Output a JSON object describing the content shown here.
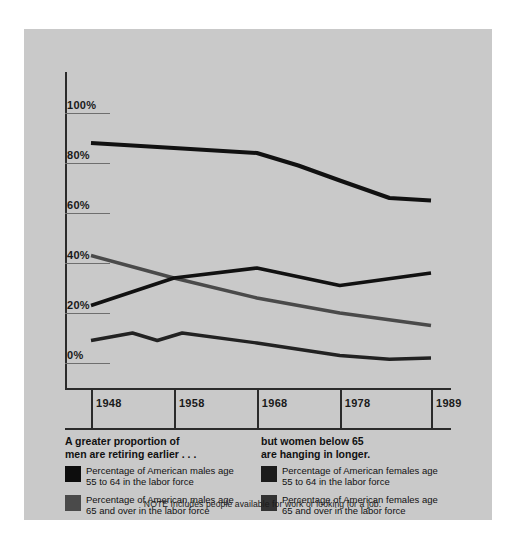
{
  "chart_data": {
    "type": "line",
    "title": "",
    "xlabel": "",
    "ylabel": "",
    "x": [
      1948,
      1958,
      1968,
      1978,
      1989
    ],
    "xtick_labels": [
      "1948",
      "1958",
      "1968",
      "1978",
      "1989"
    ],
    "ytick_labels": [
      "100%",
      "80%",
      "60%",
      "40%",
      "20%",
      "0%"
    ],
    "ytick_values": [
      100,
      80,
      60,
      40,
      20,
      0
    ],
    "ylim": [
      0,
      100
    ],
    "grid": false,
    "legend_position": "bottom",
    "series": [
      {
        "name": "Percentage of American males age 55 to 64 in the labor force",
        "color": "#111111",
        "values": [
          88,
          86,
          84,
          73,
          65
        ]
      },
      {
        "name": "Percentage of American males age 65 and over in the labor force",
        "color": "#4a4a4a",
        "values": [
          43,
          34,
          26,
          20,
          15
        ]
      },
      {
        "name": "Percentage of American females age 55 to 64 in the labor force",
        "color": "#111111",
        "values": [
          23,
          34,
          38,
          31,
          36
        ]
      },
      {
        "name": "Percentage of American females age 65 and over in the labor force",
        "color": "#222222",
        "values": [
          9,
          10,
          8,
          3,
          2
        ]
      }
    ],
    "extra_points": {
      "females_65_wiggle": [
        {
          "x": 1948,
          "y": 9
        },
        {
          "x": 1953,
          "y": 12
        },
        {
          "x": 1956,
          "y": 9
        },
        {
          "x": 1959,
          "y": 12
        },
        {
          "x": 1968,
          "y": 8
        },
        {
          "x": 1978,
          "y": 3
        },
        {
          "x": 1984,
          "y": 1.5
        },
        {
          "x": 1989,
          "y": 2
        }
      ]
    }
  },
  "axis": {
    "y_labels": [
      "100%",
      "80%",
      "60%",
      "40%",
      "20%",
      "0%"
    ],
    "x_labels": [
      "1948",
      "1958",
      "1968",
      "1978",
      "1989"
    ]
  },
  "legend": {
    "left": {
      "headline": "A greater proportion of\nmen are retiring earlier . . .",
      "items": [
        {
          "swatch_color": "#0d0d0d",
          "label": "Percentage of American males age\n55 to 64 in the labor force"
        },
        {
          "swatch_color": "#4a4a4a",
          "label": "Percentage of American males age\n65 and over in the labor force"
        }
      ]
    },
    "right": {
      "headline": "but women below 65\nare hanging in longer.",
      "items": [
        {
          "swatch_color": "#1c1c1c",
          "label": "Percentage of American females age\n55 to 64 in the labor force"
        },
        {
          "swatch_color": "#333333",
          "label": "Percentage of American females age\n65 and over in the labor force"
        }
      ]
    }
  },
  "note": "NOTE Includes people available for work or looking for a job.",
  "colors": {
    "panel_background": "#c9c9c9",
    "page_background": "#ffffff",
    "axis": "#2b2b2b",
    "text": "#111111"
  }
}
